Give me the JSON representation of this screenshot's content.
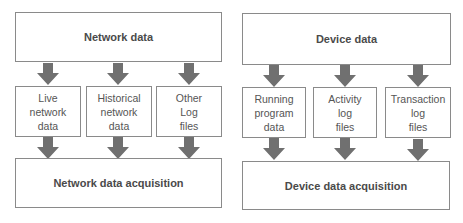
{
  "colors": {
    "arrow": "#707070",
    "border": "#8a8a8a",
    "text": "#4a4a4a"
  },
  "panels": [
    {
      "top": {
        "label": "Network data"
      },
      "sources": [
        {
          "label": "Live\nnetwork\ndata"
        },
        {
          "label": "Historical\nnetwork\ndata"
        },
        {
          "label": "Other\nLog\nfiles"
        }
      ],
      "bottom": {
        "label": "Network data acquisition"
      }
    },
    {
      "top": {
        "label": "Device data"
      },
      "sources": [
        {
          "label": "Running\nprogram\ndata"
        },
        {
          "label": "Activity\nlog\nfiles"
        },
        {
          "label": "Transaction\nlog\nfiles"
        }
      ],
      "bottom": {
        "label": "Device data acquisition"
      }
    }
  ]
}
